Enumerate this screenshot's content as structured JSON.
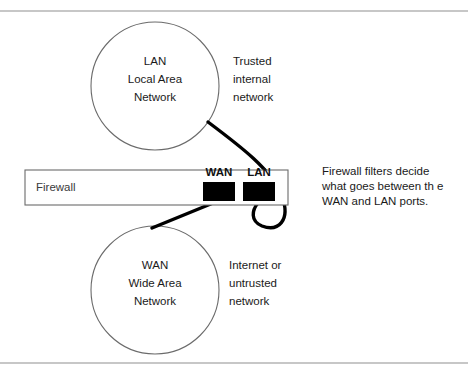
{
  "figure": {
    "background_color": "#ffffff",
    "ink_color": "#1a1a1a",
    "outline_color": "#6b6b6b",
    "rule_color": "#8f8f8f",
    "cable_color": "#000000",
    "port_color": "#000000"
  },
  "rules": {
    "top_label": "",
    "bottom_label": ""
  },
  "lan_node": {
    "line1": "LAN",
    "line2": "Local Area",
    "line3": "Network"
  },
  "wan_node": {
    "line1": "WAN",
    "line2": "Wide Area",
    "line3": "Network"
  },
  "lan_caption": {
    "line1": "Trusted",
    "line2": "internal",
    "line3": "network"
  },
  "wan_caption": {
    "line1": "Internet or",
    "line2": "untrusted",
    "line3": "network"
  },
  "firewall": {
    "label": "Firewall",
    "wan_port_label": "WAN",
    "lan_port_label": "LAN"
  },
  "firewall_caption": {
    "line1": "Firewall filters decide",
    "line2": "what goes between th e",
    "line3": "WAN and LAN ports."
  }
}
